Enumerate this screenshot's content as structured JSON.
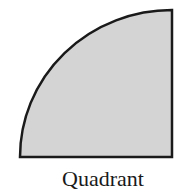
{
  "figure": {
    "shape": "quadrant",
    "label": "Quadrant",
    "fill_color": "#d4d4d4",
    "stroke_color": "#1a1a1a"
  }
}
